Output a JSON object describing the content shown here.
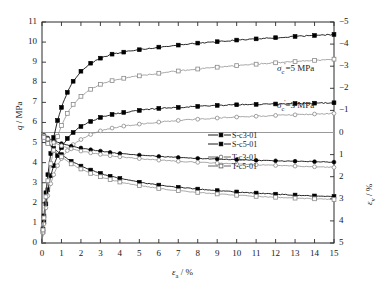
{
  "chart_data": {
    "type": "line",
    "title": "",
    "xlabel": "εa / %",
    "ylabel_left": "q / MPa",
    "ylabel_right": "εv / %",
    "xlim": [
      0,
      15
    ],
    "ylim_left": [
      0,
      11
    ],
    "ylim_right": [
      -5,
      5
    ],
    "right_axis_inverted": true,
    "grid": false,
    "xticks": [
      0,
      1,
      2,
      3,
      4,
      5,
      6,
      7,
      8,
      9,
      10,
      11,
      12,
      13,
      14,
      15
    ],
    "yticks_left": [
      0,
      1,
      2,
      3,
      4,
      5,
      6,
      7,
      8,
      9,
      10,
      11
    ],
    "yticks_right": [
      -5,
      -4,
      -3,
      -2,
      -1,
      0,
      1,
      2,
      3,
      4,
      5
    ],
    "legend_position": "center-right",
    "annotations": [
      {
        "text": "σc'=5 MPa",
        "x": 12.2,
        "y": 8.0
      },
      {
        "text": "σc'=3 MPa",
        "x": 12.2,
        "y": 5.6
      }
    ],
    "series": [
      {
        "name": "S-c3-01",
        "axis": "left",
        "marker": "filled-square",
        "line": "solid",
        "color": "#000000",
        "x": [
          0,
          0.05,
          0.1,
          0.2,
          0.3,
          0.45,
          0.6,
          0.8,
          1.0,
          1.3,
          1.6,
          2.0,
          2.5,
          3.0,
          3.6,
          4.2,
          5.0,
          6.0,
          7.0,
          8.0,
          9.0,
          10.0,
          11.0,
          12.0,
          13.0,
          14.0,
          15.0
        ],
        "y": [
          0,
          0.55,
          1.05,
          1.95,
          2.65,
          3.35,
          3.85,
          4.35,
          4.75,
          5.2,
          5.5,
          5.8,
          6.05,
          6.25,
          6.4,
          6.5,
          6.6,
          6.7,
          6.75,
          6.8,
          6.85,
          6.88,
          6.9,
          6.92,
          6.94,
          6.96,
          6.98
        ]
      },
      {
        "name": "S-c5-01",
        "axis": "left",
        "marker": "filled-square",
        "line": "solid",
        "color": "#000000",
        "x": [
          0,
          0.05,
          0.1,
          0.2,
          0.3,
          0.45,
          0.6,
          0.8,
          1.0,
          1.3,
          1.6,
          2.0,
          2.5,
          3.0,
          3.6,
          4.2,
          5.0,
          6.0,
          7.0,
          8.0,
          9.0,
          10.0,
          11.0,
          12.0,
          13.0,
          14.0,
          15.0
        ],
        "y": [
          0,
          0.7,
          1.35,
          2.5,
          3.4,
          4.45,
          5.25,
          6.1,
          6.75,
          7.5,
          8.05,
          8.55,
          8.95,
          9.2,
          9.4,
          9.5,
          9.62,
          9.75,
          9.85,
          9.95,
          10.02,
          10.1,
          10.16,
          10.22,
          10.28,
          10.33,
          10.38
        ]
      },
      {
        "name": "T-c3-01",
        "axis": "left",
        "marker": "open-circle",
        "line": "solid",
        "color": "#8a8a8a",
        "x": [
          0,
          0.05,
          0.1,
          0.2,
          0.3,
          0.45,
          0.6,
          0.8,
          1.0,
          1.3,
          1.6,
          2.0,
          2.5,
          3.0,
          3.6,
          4.2,
          5.0,
          6.0,
          7.0,
          8.0,
          9.0,
          10.0,
          11.0,
          12.0,
          13.0,
          14.0,
          15.0
        ],
        "y": [
          0,
          0.5,
          0.95,
          1.75,
          2.35,
          2.95,
          3.4,
          3.85,
          4.2,
          4.6,
          4.9,
          5.15,
          5.4,
          5.58,
          5.72,
          5.82,
          5.92,
          6.02,
          6.1,
          6.16,
          6.22,
          6.27,
          6.31,
          6.35,
          6.38,
          6.42,
          6.45
        ]
      },
      {
        "name": "T-c5-01",
        "axis": "left",
        "marker": "open-square",
        "line": "solid",
        "color": "#8a8a8a",
        "x": [
          0,
          0.05,
          0.1,
          0.2,
          0.3,
          0.45,
          0.6,
          0.8,
          1.0,
          1.3,
          1.6,
          2.0,
          2.5,
          3.0,
          3.6,
          4.2,
          5.0,
          6.0,
          7.0,
          8.0,
          9.0,
          10.0,
          11.0,
          12.0,
          13.0,
          14.0,
          15.0
        ],
        "y": [
          0,
          0.65,
          1.25,
          2.3,
          3.1,
          3.95,
          4.6,
          5.3,
          5.85,
          6.45,
          6.9,
          7.3,
          7.65,
          7.9,
          8.08,
          8.2,
          8.32,
          8.45,
          8.56,
          8.66,
          8.75,
          8.83,
          8.9,
          8.97,
          9.03,
          9.09,
          9.15
        ]
      },
      {
        "name": "S-c3-01-vol",
        "axis": "right",
        "marker": "filled-circle",
        "line": "solid",
        "color": "#000000",
        "x": [
          0,
          0.1,
          0.3,
          0.6,
          1.0,
          1.5,
          2.0,
          2.5,
          3.0,
          3.5,
          4.0,
          5.0,
          6.0,
          7.0,
          8.0,
          9.0,
          10.0,
          11.0,
          12.0,
          13.0,
          14.0,
          15.0
        ],
        "y": [
          0,
          0.12,
          0.25,
          0.38,
          0.5,
          0.62,
          0.7,
          0.78,
          0.84,
          0.9,
          0.95,
          1.02,
          1.08,
          1.13,
          1.17,
          1.2,
          1.23,
          1.26,
          1.28,
          1.3,
          1.32,
          1.34
        ]
      },
      {
        "name": "S-c5-01-vol",
        "axis": "right",
        "marker": "filled-square",
        "line": "solid",
        "color": "#000000",
        "x": [
          0,
          0.1,
          0.3,
          0.6,
          1.0,
          1.5,
          2.0,
          2.5,
          3.0,
          3.5,
          4.0,
          5.0,
          6.0,
          7.0,
          8.0,
          9.0,
          10.0,
          11.0,
          12.0,
          13.0,
          14.0,
          15.0
        ],
        "y": [
          0,
          0.2,
          0.45,
          0.72,
          1.0,
          1.3,
          1.52,
          1.7,
          1.85,
          1.98,
          2.08,
          2.25,
          2.38,
          2.48,
          2.56,
          2.63,
          2.69,
          2.74,
          2.79,
          2.83,
          2.87,
          2.9
        ]
      },
      {
        "name": "T-c3-01-vol",
        "axis": "right",
        "marker": "open-circle",
        "line": "solid",
        "color": "#8a8a8a",
        "x": [
          0,
          0.1,
          0.3,
          0.6,
          1.0,
          1.5,
          2.0,
          2.5,
          3.0,
          3.5,
          4.0,
          5.0,
          6.0,
          7.0,
          8.0,
          9.0,
          10.0,
          11.0,
          12.0,
          13.0,
          14.0,
          15.0
        ],
        "y": [
          0,
          0.15,
          0.3,
          0.45,
          0.6,
          0.74,
          0.84,
          0.92,
          0.99,
          1.05,
          1.1,
          1.18,
          1.25,
          1.3,
          1.35,
          1.39,
          1.43,
          1.46,
          1.49,
          1.52,
          1.55,
          1.58
        ]
      },
      {
        "name": "T-c5-01-vol",
        "axis": "right",
        "marker": "open-square",
        "line": "solid",
        "color": "#8a8a8a",
        "x": [
          0,
          0.1,
          0.3,
          0.6,
          1.0,
          1.5,
          2.0,
          2.5,
          3.0,
          3.5,
          4.0,
          5.0,
          6.0,
          7.0,
          8.0,
          9.0,
          10.0,
          11.0,
          12.0,
          13.0,
          14.0,
          15.0
        ],
        "y": [
          0,
          0.22,
          0.5,
          0.8,
          1.1,
          1.42,
          1.65,
          1.85,
          2.0,
          2.13,
          2.24,
          2.4,
          2.53,
          2.63,
          2.71,
          2.78,
          2.84,
          2.89,
          2.93,
          2.97,
          3.0,
          3.03
        ]
      }
    ]
  },
  "axes": {
    "left_label_q": "q",
    "left_label_unit": "/ MPa",
    "right_label_eps": "ε",
    "right_label_sub": "v",
    "right_label_unit": "/ %",
    "x_label_eps": "ε",
    "x_label_sub": "a",
    "x_label_unit": "/ %"
  },
  "annotations": {
    "sigma5": {
      "sigma": "σ",
      "sub": "c",
      "sup": "'",
      "rest": "=5 MPa"
    },
    "sigma3": {
      "sigma": "σ",
      "sub": "c",
      "sup": "'",
      "rest": "=3 MPa"
    }
  },
  "legend": {
    "items": [
      {
        "label": "S-c3-01",
        "marker": "filled-square",
        "color": "#000000"
      },
      {
        "label": "S-c5-01",
        "marker": "filled-square",
        "color": "#000000"
      },
      {
        "label": "T-c3-01",
        "marker": "open-circle",
        "color": "#555555"
      },
      {
        "label": "T-c5-01",
        "marker": "open-square",
        "color": "#555555"
      }
    ]
  }
}
